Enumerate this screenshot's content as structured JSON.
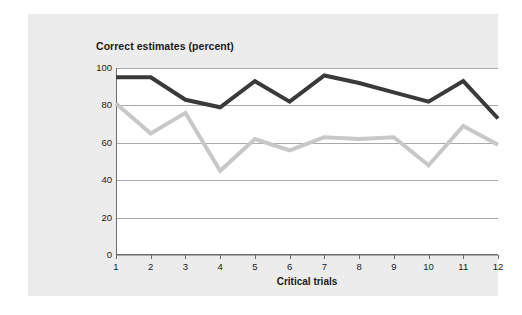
{
  "figure": {
    "background_color": "#ffffff",
    "panel_color": "#ececed"
  },
  "chart_data": {
    "type": "line",
    "title": "Correct estimates (percent)",
    "xlabel": "Critical trials",
    "ylabel": "",
    "categories": [
      "1",
      "2",
      "3",
      "4",
      "5",
      "6",
      "7",
      "8",
      "9",
      "10",
      "11",
      "12"
    ],
    "x": [
      1,
      2,
      3,
      4,
      5,
      6,
      7,
      8,
      9,
      10,
      11,
      12
    ],
    "xlim": [
      1,
      12
    ],
    "ylim": [
      0,
      100
    ],
    "yticks": [
      0,
      20,
      40,
      60,
      80,
      100
    ],
    "ytick_labels": [
      "0",
      "20",
      "40",
      "60",
      "80",
      "100"
    ],
    "grid": true,
    "grid_axis": "y",
    "grid_color": "#aaaaac",
    "legend": "none",
    "series": [
      {
        "name": "dark-series",
        "color": "#3a3a3a",
        "line_width": 4,
        "values": [
          95,
          95,
          83,
          79,
          93,
          82,
          96,
          92,
          87,
          82,
          93,
          73
        ]
      },
      {
        "name": "light-series",
        "color": "#c8c8c8",
        "line_width": 4,
        "values": [
          81,
          65,
          76,
          45,
          62,
          56,
          63,
          62,
          63,
          48,
          69,
          59
        ]
      }
    ]
  }
}
